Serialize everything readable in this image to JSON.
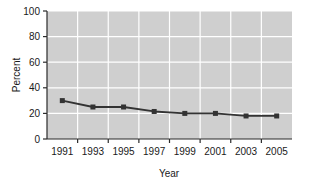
{
  "chart_data": {
    "type": "line",
    "title": "",
    "xlabel": "Year",
    "ylabel": "Percent",
    "x": [
      1991,
      1992,
      1993,
      1994,
      1995,
      1996,
      1997,
      1998,
      1999,
      2000,
      2001,
      2002,
      2003,
      2004,
      2005
    ],
    "categories": [
      "1991",
      "1993",
      "1995",
      "1997",
      "1999",
      "2001",
      "2003",
      "2005"
    ],
    "series": [
      {
        "name": "Percent",
        "x": [
          1991,
          1993,
          1995,
          1997,
          1999,
          2001,
          2003,
          2005
        ],
        "values": [
          30,
          25,
          25,
          21.5,
          20,
          20,
          18,
          18
        ]
      }
    ],
    "xlim": [
      1990,
      2006
    ],
    "ylim": [
      0,
      100
    ],
    "yticks": [
      0,
      20,
      40,
      60,
      80,
      100
    ],
    "ytick_labels": [
      "0",
      "20",
      "40",
      "60",
      "80",
      "100"
    ],
    "xticks": [
      1991,
      1993,
      1995,
      1997,
      1999,
      2001,
      2003,
      2005
    ],
    "xtick_labels": [
      "1991",
      "1993",
      "1995",
      "1997",
      "1999",
      "2001",
      "2003",
      "2005"
    ],
    "grid": true,
    "grid_color": "#ffffff",
    "plot_background": "#cfcfcf",
    "line_color": "#333333",
    "marker_color": "#333333",
    "marker_shape": "square",
    "legend": null,
    "legend_position": "none"
  },
  "axes": {
    "y_label": "Percent",
    "x_label": "Year"
  }
}
